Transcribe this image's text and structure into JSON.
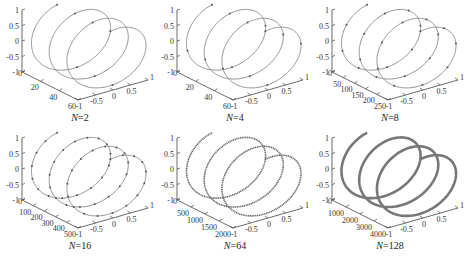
{
  "figure": {
    "panels": [
      {
        "id": "p1",
        "caption_var": "N",
        "caption_val": "=2",
        "depth_ticks": [
          "0",
          "20",
          "40",
          "60"
        ],
        "depth_max": 60,
        "markers": 2,
        "curve_style": "thin"
      },
      {
        "id": "p2",
        "caption_var": "N",
        "caption_val": "=4",
        "depth_ticks": [
          "0",
          "20",
          "40",
          "60"
        ],
        "depth_max": 60,
        "markers": 4,
        "curve_style": "thin"
      },
      {
        "id": "p3",
        "caption_var": "N",
        "caption_val": "=8",
        "depth_ticks": [
          "0",
          "50",
          "100",
          "150",
          "200",
          "250"
        ],
        "depth_max": 250,
        "markers": 8,
        "curve_style": "thin"
      },
      {
        "id": "p4",
        "caption_var": "N",
        "caption_val": "=16",
        "depth_ticks": [
          "0",
          "100",
          "200",
          "300",
          "400",
          "500"
        ],
        "depth_max": 500,
        "markers": 16,
        "curve_style": "thin"
      },
      {
        "id": "p5",
        "caption_var": "N",
        "caption_val": "=64",
        "depth_ticks": [
          "0",
          "500",
          "1000",
          "1500",
          "2000"
        ],
        "depth_max": 2000,
        "markers": 64,
        "curve_style": "dotted"
      },
      {
        "id": "p6",
        "caption_var": "N",
        "caption_val": "=128",
        "depth_ticks": [
          "0",
          "1000",
          "2000",
          "3000",
          "4000"
        ],
        "depth_max": 4000,
        "markers": 128,
        "curve_style": "thick"
      }
    ],
    "z_ticks": [
      "1",
      "0.5",
      "0",
      "-0.5",
      "-1"
    ],
    "x_ticks": [
      "-1",
      "-0.5",
      "0",
      "0.5",
      "1"
    ]
  },
  "chart_data": [
    {
      "type": "line3d",
      "title": "N=2",
      "curve": "helix (3 turns) of unit radius",
      "xlim": [
        -1,
        1
      ],
      "ylim": [
        0,
        60
      ],
      "zlim": [
        -1,
        1
      ],
      "y_ticks": [
        0,
        20,
        40,
        60
      ],
      "x_ticks": [
        -1,
        -0.5,
        0,
        0.5,
        1
      ],
      "z_ticks": [
        -1,
        -0.5,
        0,
        0.5,
        1
      ],
      "points_per_turn_marked": 2
    },
    {
      "type": "line3d",
      "title": "N=4",
      "curve": "helix (3 turns) of unit radius",
      "xlim": [
        -1,
        1
      ],
      "ylim": [
        0,
        60
      ],
      "zlim": [
        -1,
        1
      ],
      "y_ticks": [
        0,
        20,
        40,
        60
      ],
      "x_ticks": [
        -1,
        -0.5,
        0,
        0.5,
        1
      ],
      "z_ticks": [
        -1,
        -0.5,
        0,
        0.5,
        1
      ],
      "points_per_turn_marked": 4
    },
    {
      "type": "line3d",
      "title": "N=8",
      "curve": "helix (3 turns) of unit radius",
      "xlim": [
        -1,
        1
      ],
      "ylim": [
        0,
        250
      ],
      "zlim": [
        -1,
        1
      ],
      "y_ticks": [
        0,
        50,
        100,
        150,
        200,
        250
      ],
      "x_ticks": [
        -1,
        -0.5,
        0,
        0.5,
        1
      ],
      "z_ticks": [
        -1,
        -0.5,
        0,
        0.5,
        1
      ],
      "points_per_turn_marked": 8
    },
    {
      "type": "line3d",
      "title": "N=16",
      "curve": "helix (3 turns) of unit radius",
      "xlim": [
        -1,
        1
      ],
      "ylim": [
        0,
        500
      ],
      "zlim": [
        -1,
        1
      ],
      "y_ticks": [
        0,
        100,
        200,
        300,
        400,
        500
      ],
      "x_ticks": [
        -1,
        -0.5,
        0,
        0.5,
        1
      ],
      "z_ticks": [
        -1,
        -0.5,
        0,
        0.5,
        1
      ],
      "points_per_turn_marked": 16
    },
    {
      "type": "line3d",
      "title": "N=64",
      "curve": "helix (3 turns) of unit radius",
      "xlim": [
        -1,
        1
      ],
      "ylim": [
        0,
        2000
      ],
      "zlim": [
        -1,
        1
      ],
      "y_ticks": [
        0,
        500,
        1000,
        1500,
        2000
      ],
      "x_ticks": [
        -1,
        -0.5,
        0,
        0.5,
        1
      ],
      "z_ticks": [
        -1,
        -0.5,
        0,
        0.5,
        1
      ],
      "points_per_turn_marked": 64
    },
    {
      "type": "line3d",
      "title": "N=128",
      "curve": "helix (3 turns) of unit radius",
      "xlim": [
        -1,
        1
      ],
      "ylim": [
        0,
        4000
      ],
      "zlim": [
        -1,
        1
      ],
      "y_ticks": [
        0,
        1000,
        2000,
        3000,
        4000
      ],
      "x_ticks": [
        -1,
        -0.5,
        0,
        0.5,
        1
      ],
      "z_ticks": [
        -1,
        -0.5,
        0,
        0.5,
        1
      ],
      "points_per_turn_marked": 128
    }
  ]
}
